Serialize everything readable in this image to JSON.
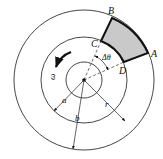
{
  "diagram": {
    "center": [
      84,
      80
    ],
    "circles": {
      "inner_radius_px": 18,
      "middle_radius_px": 43,
      "outer_radius_px": 70
    },
    "element_colors": {
      "fill": "#c9c9c9",
      "stroke": "#111111"
    },
    "labels": {
      "A": "A",
      "B": "B",
      "C": "C",
      "D": "D",
      "delta_theta": "Δθ",
      "omega": "ω",
      "a": "a",
      "b": "b",
      "r": "r"
    },
    "annotations": {
      "rotation_direction": "counterclockwise",
      "dimension_a": "inner radius a (center to middle circle)",
      "dimension_b": "outer radius b (center to outer circle)",
      "dimension_r": "radial coordinate r"
    }
  }
}
